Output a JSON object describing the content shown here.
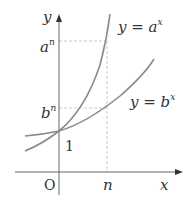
{
  "diagram": {
    "axes": {
      "x_label": "x",
      "y_label": "y",
      "origin_label": "O"
    },
    "curves": [
      {
        "name": "y = a^x",
        "label_prefix": "y = a",
        "label_sup": "x",
        "color": "#8a8a8a"
      },
      {
        "name": "y = b^x",
        "label_prefix": "y = b",
        "label_sup": "x",
        "color": "#8a8a8a"
      }
    ],
    "markers": {
      "x_tick": "n",
      "y_tick_one": "1",
      "a_n": {
        "base": "a",
        "sup": "n"
      },
      "b_n": {
        "base": "b",
        "sup": "n"
      }
    },
    "colors": {
      "axis": "#555555",
      "curve": "#8a8a8a",
      "dashed": "#c8c8c8",
      "text": "#333333"
    }
  }
}
